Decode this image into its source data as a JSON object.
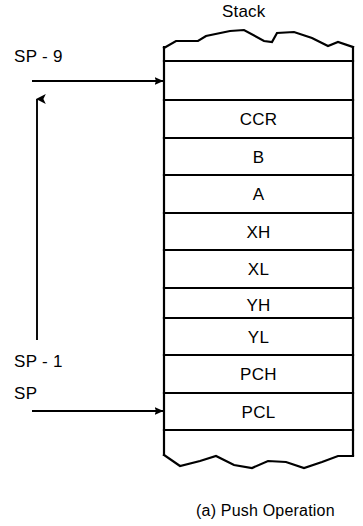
{
  "diagram": {
    "title": "Stack",
    "caption": "(a) Push Operation",
    "type": "stack-push-diagram"
  },
  "stack": {
    "title": "Stack",
    "top_edge": "torn-jagged-edge",
    "bottom_edge": "torn-jagged-edge",
    "cells": [
      {
        "label": "",
        "name": "stack-cell-empty-top"
      },
      {
        "label": "",
        "name": "stack-cell-sp-minus-9-target"
      },
      {
        "label": "CCR",
        "name": "stack-cell-ccr"
      },
      {
        "label": "B",
        "name": "stack-cell-b"
      },
      {
        "label": "A",
        "name": "stack-cell-a"
      },
      {
        "label": "XH",
        "name": "stack-cell-xh"
      },
      {
        "label": "XL",
        "name": "stack-cell-xl"
      },
      {
        "label": "YH",
        "name": "stack-cell-yh"
      },
      {
        "label": "YL",
        "name": "stack-cell-yl"
      },
      {
        "label": "PCH",
        "name": "stack-cell-pch"
      },
      {
        "label": "PCL",
        "name": "stack-cell-pcl"
      },
      {
        "label": "",
        "name": "stack-cell-empty-bottom"
      }
    ]
  },
  "pointers": [
    {
      "label": "SP - 9",
      "name": "pointer-sp-minus-9",
      "target_cell": "stack-cell-sp-minus-9-target"
    },
    {
      "label": "SP - 1",
      "name": "pointer-sp-minus-1",
      "target_cell": "stack-cell-pch"
    },
    {
      "label": "SP",
      "name": "pointer-sp",
      "target_cell": "stack-cell-pcl"
    }
  ],
  "arrows": {
    "top_horizontal": "arrow-right-to-sp-minus-9",
    "bottom_horizontal": "arrow-right-to-sp",
    "vertical": "arrow-up-growth-direction"
  },
  "colors": {
    "stroke": "#000000",
    "background": "#ffffff",
    "text": "#000000"
  }
}
